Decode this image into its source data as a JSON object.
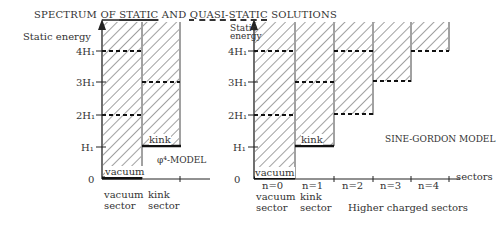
{
  "title": {
    "prefix": "SPECTRUM OF ",
    "static": "STATIC",
    "and": " AND ",
    "quasi": "QUASI-STATIC",
    "suffix": " SOLUTIONS"
  },
  "left_plot": {
    "ylabel": "Static energy",
    "levels": [
      "4H₁",
      "3H₁",
      "2H₁",
      "H₁",
      "0"
    ],
    "model_label": "φ⁴-MODEL",
    "columns": [
      {
        "name": "vacuum",
        "inside_label": "vacuum",
        "below": [
          "vacuum",
          "sector"
        ],
        "floor": 0
      },
      {
        "name": "kink",
        "inside_label": "kink",
        "below": [
          "kink",
          "sector"
        ],
        "floor": 1
      }
    ]
  },
  "right_plot": {
    "ylabel_line1": "Static",
    "ylabel_line2": "energy",
    "levels": [
      "4H₁",
      "3H₁",
      "2H₁",
      "H₁",
      "0"
    ],
    "model_label": "SINE-GORDON MODEL",
    "xlabel": "sectors",
    "higher_label": "Higher charged sectors",
    "columns": [
      {
        "n": "n=0",
        "inside_label": "vacuum",
        "below": [
          "vacuum",
          "sector"
        ],
        "floor": 0
      },
      {
        "n": "n=1",
        "inside_label": "kink",
        "below": [
          "kink",
          "sector"
        ],
        "floor": 1
      },
      {
        "n": "n=2",
        "floor": 2
      },
      {
        "n": "n=3",
        "floor": 3
      },
      {
        "n": "n=4",
        "floor": 4
      }
    ]
  }
}
